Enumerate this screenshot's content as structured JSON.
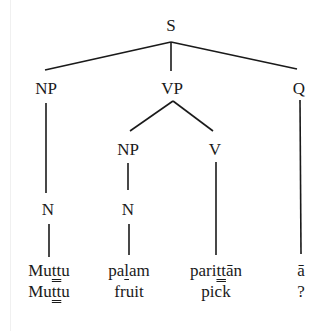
{
  "diagram": {
    "type": "syntax-tree",
    "nodes": {
      "S": {
        "label": "S",
        "x": 171,
        "y": 16
      },
      "NP1": {
        "label": "NP",
        "x": 46,
        "y": 80
      },
      "VP": {
        "label": "VP",
        "x": 172,
        "y": 80
      },
      "Q": {
        "label": "Q",
        "x": 299,
        "y": 80
      },
      "NP2": {
        "label": "NP",
        "x": 128,
        "y": 141
      },
      "V": {
        "label": "V",
        "x": 215,
        "y": 141
      },
      "N1": {
        "label": "N",
        "x": 48,
        "y": 201
      },
      "N2": {
        "label": "N",
        "x": 128,
        "y": 201
      }
    },
    "edges": [
      [
        "S",
        "NP1"
      ],
      [
        "S",
        "VP"
      ],
      [
        "S",
        "Q"
      ],
      [
        "VP",
        "NP2"
      ],
      [
        "VP",
        "V"
      ],
      [
        "NP1",
        "N1"
      ],
      [
        "NP2",
        "N2"
      ],
      [
        "N1",
        "w1"
      ],
      [
        "N2",
        "w2"
      ],
      [
        "V",
        "w3"
      ],
      [
        "Q",
        "w4"
      ]
    ],
    "words": [
      {
        "id": "w1",
        "pre": "Mu",
        "mark": "ṯṯ",
        "post": "u",
        "mark_style": "double-underline",
        "gloss": "Muttu",
        "gloss_pre": "Mu",
        "gloss_mark": "ṯṯ",
        "gloss_post": "u",
        "x": 49
      },
      {
        "id": "w2",
        "pre": "pa",
        "mark": "l",
        "post": "am",
        "mark_style": "underline",
        "gloss": "fruit",
        "x": 129
      },
      {
        "id": "w3",
        "pre": "pari",
        "mark": "ṯṯ",
        "post": "ān",
        "mark_style": "double-underline",
        "gloss": "pick",
        "x": 216
      },
      {
        "id": "w4",
        "pre": "ā",
        "mark": "",
        "post": "",
        "mark_style": "none",
        "gloss": "?",
        "x": 300
      }
    ],
    "word_row_y": 262,
    "gloss_row_y": 283
  },
  "text": {
    "S": "S",
    "NP": "NP",
    "VP": "VP",
    "Q": "Q",
    "NP2": "NP",
    "V": "V",
    "N1": "N",
    "N2": "N",
    "w1_pre": "Mu",
    "w1_mark": "tt",
    "w1_post": "u",
    "w2_pre": "pa",
    "w2_mark": "l",
    "w2_post": "am",
    "w3_pre": "pari",
    "w3_mark": "tt",
    "w3_post": "ān",
    "w4": "ā",
    "g1_pre": "Mu",
    "g1_mark": "tt",
    "g1_post": "u",
    "g2": "fruit",
    "g3": "pick",
    "g4": "?"
  },
  "colors": {
    "ink": "#1a1a1a",
    "background": "#ffffff"
  }
}
